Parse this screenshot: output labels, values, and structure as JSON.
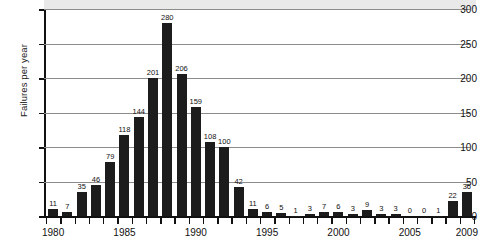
{
  "chart_data": {
    "type": "bar",
    "title": "",
    "subtitle": "",
    "xlabel": "",
    "ylabel": "Failures per year",
    "ylim": [
      0,
      300
    ],
    "ytick_values": [
      0,
      50,
      100,
      150,
      200,
      250,
      300
    ],
    "ytick_labels": [
      "0",
      "50",
      "100",
      "150",
      "200",
      "250",
      "300"
    ],
    "grid": "horizontal",
    "legend": "none",
    "xtick_labels": [
      "1980",
      "1985",
      "1990",
      "1995",
      "2000",
      "2005",
      "2009"
    ],
    "xtick_years": [
      1980,
      1985,
      1990,
      1995,
      2000,
      2005,
      2009
    ],
    "categories": [
      "1980",
      "1981",
      "1982",
      "1983",
      "1984",
      "1985",
      "1986",
      "1987",
      "1988",
      "1989",
      "1990",
      "1991",
      "1992",
      "1993",
      "1994",
      "1995",
      "1996",
      "1997",
      "1998",
      "1999",
      "2000",
      "2001",
      "2002",
      "2003",
      "2004",
      "2005",
      "2006",
      "2007",
      "2008",
      "2009"
    ],
    "values": [
      11,
      7,
      35,
      46,
      79,
      118,
      144,
      201,
      280,
      206,
      159,
      108,
      100,
      42,
      11,
      6,
      5,
      1,
      3,
      7,
      6,
      3,
      9,
      3,
      3,
      0,
      0,
      1,
      22,
      36
    ],
    "data_labels": [
      "11",
      "7",
      "35",
      "46",
      "79",
      "118",
      "144",
      "201",
      "280",
      "206",
      "159",
      "108",
      "100",
      "42",
      "11",
      "6",
      "5",
      "1",
      "3",
      "7",
      "6",
      "3",
      "9",
      "3",
      "3",
      "0",
      "0",
      "1",
      "22",
      "36"
    ],
    "bar_color": "#1c1c1c",
    "gridline_color": "#8c8c8c",
    "axis_color": "#111111",
    "top_band_color": "#e9e9e9"
  }
}
